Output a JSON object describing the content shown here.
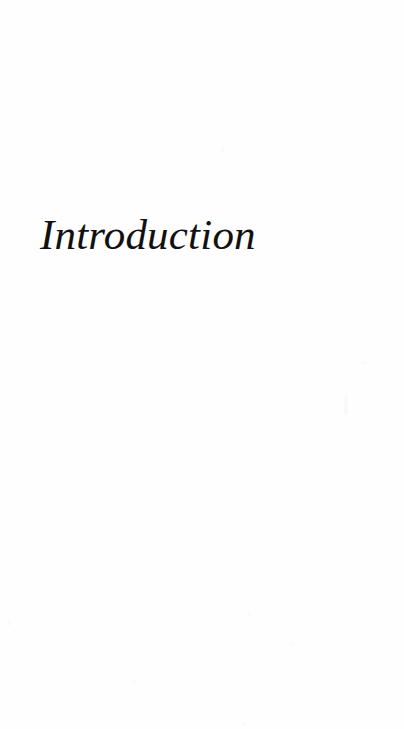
{
  "page": {
    "kind": "book-chapter-opening-page",
    "background_color": "#fefefe",
    "text_color": "#111111",
    "width": 404,
    "height": 729
  },
  "heading": {
    "text": "Introduction",
    "style": "italic-serif",
    "font_size_px": 43,
    "left_px": 42,
    "baseline_y_px": 253
  },
  "body": {
    "paragraphs": []
  },
  "artifacts": {
    "description": "faint scanner speckles",
    "count": 8
  }
}
